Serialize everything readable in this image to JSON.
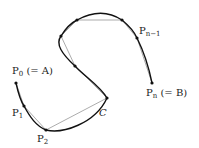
{
  "diagram": {
    "type": "curve-polygonal-approximation",
    "curve_label": "C",
    "colors": {
      "curve": "#111111",
      "chords": "#888888",
      "points": "#111111",
      "text": "#222222"
    },
    "points": [
      {
        "id": "P0",
        "x": 16,
        "y": 83,
        "label_main": "P",
        "label_sub": "0",
        "label_suffix": " (= A)"
      },
      {
        "id": "P1",
        "x": 24,
        "y": 106,
        "label_main": "P",
        "label_sub": "1",
        "label_suffix": ""
      },
      {
        "id": "P2",
        "x": 46,
        "y": 130,
        "label_main": "P",
        "label_sub": "2",
        "label_suffix": ""
      },
      {
        "id": "P3",
        "x": 107,
        "y": 98,
        "label_main": "",
        "label_sub": "",
        "label_suffix": ""
      },
      {
        "id": "P4",
        "x": 75,
        "y": 66,
        "label_main": "",
        "label_sub": "",
        "label_suffix": ""
      },
      {
        "id": "P5",
        "x": 61,
        "y": 36,
        "label_main": "",
        "label_sub": "",
        "label_suffix": ""
      },
      {
        "id": "P6",
        "x": 77,
        "y": 20,
        "label_main": "",
        "label_sub": "",
        "label_suffix": ""
      },
      {
        "id": "P7",
        "x": 122,
        "y": 20,
        "label_main": "",
        "label_sub": "",
        "label_suffix": ""
      },
      {
        "id": "Pn-1",
        "x": 137,
        "y": 38,
        "label_main": "P",
        "label_sub": "n−1",
        "label_suffix": ""
      },
      {
        "id": "Pn",
        "x": 152,
        "y": 83,
        "label_main": "P",
        "label_sub": "n",
        "label_suffix": " (= B)"
      }
    ],
    "labels": {
      "p0": {
        "main": "P",
        "sub": "0",
        "suffix": " (= A)"
      },
      "p1": {
        "main": "P",
        "sub": "1"
      },
      "p2": {
        "main": "P",
        "sub": "2"
      },
      "pn1": {
        "main": "P",
        "sub": "n−1"
      },
      "pn": {
        "main": "P",
        "sub": "n",
        "suffix": " (= B)"
      },
      "c": "C"
    }
  }
}
